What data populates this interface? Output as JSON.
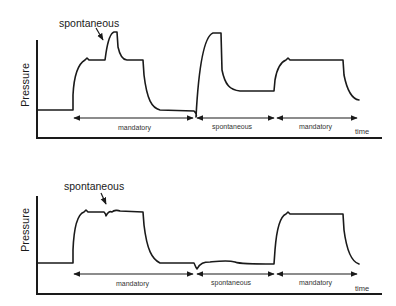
{
  "panels": [
    {
      "id": "top",
      "y_axis_label": "Pressure",
      "x_axis_label": "time",
      "annotation": "spontaneous",
      "segments": [
        {
          "label": "mandatory"
        },
        {
          "label": "spontaneous"
        },
        {
          "label": "mandatory"
        }
      ]
    },
    {
      "id": "bottom",
      "y_axis_label": "Pressure",
      "x_axis_label": "time",
      "annotation": "spontaneous",
      "segments": [
        {
          "label": "mandatory"
        },
        {
          "label": "spontaneous"
        }
      ],
      "final_segment": {
        "label": "mandatory"
      }
    }
  ],
  "colors": {
    "line": "#1a1a1a",
    "background": "#ffffff",
    "text": "#333333"
  }
}
